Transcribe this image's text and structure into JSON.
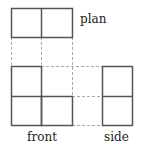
{
  "diagram": {
    "colors": {
      "stroke": "#555555",
      "guide": "#aaaaaa"
    },
    "views": [
      {
        "name": "plan",
        "label": "plan"
      },
      {
        "name": "front",
        "label": "front"
      },
      {
        "name": "side",
        "label": "side"
      }
    ]
  }
}
